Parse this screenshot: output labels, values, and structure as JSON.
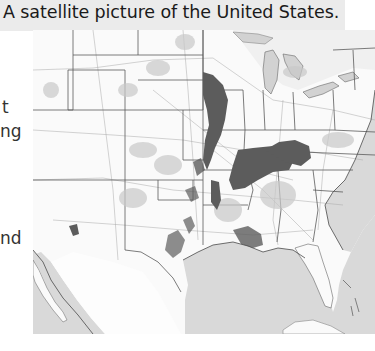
{
  "caption": {
    "text": "A satellite picture of the United States."
  },
  "side_text_fragments": [
    {
      "text": "t",
      "top": 97
    },
    {
      "text": "ng",
      "top": 121
    },
    {
      "text": "nd",
      "top": 228
    }
  ],
  "map": {
    "subject": "satellite-style map of the contiguous United States (grayscale)",
    "colors": {
      "land": "#fafafa",
      "water": "#d9d9d9",
      "state_lines": "#555555",
      "roads": "#9a9a9a",
      "dark_regions": "#5c5c5c",
      "mid_regions": "#bdbdbd"
    }
  }
}
